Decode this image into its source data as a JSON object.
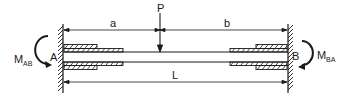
{
  "diagram": {
    "labels": {
      "load": "P",
      "dim_a": "a",
      "dim_b": "b",
      "dim_L": "L",
      "support_left": "A",
      "support_right": "B",
      "moment_left_main": "M",
      "moment_left_sub": "AB",
      "moment_right_main": "M",
      "moment_right_sub": "BA"
    },
    "colors": {
      "stroke": "#1a1a1a",
      "background": "#ffffff"
    }
  }
}
